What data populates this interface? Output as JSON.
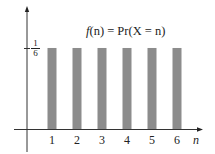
{
  "chart_data": {
    "type": "bar",
    "title": "f(n) = Pr(X = n)",
    "xlabel": "n",
    "ylabel": "",
    "categories": [
      "1",
      "2",
      "3",
      "4",
      "5",
      "6"
    ],
    "values": [
      0.1667,
      0.1667,
      0.1667,
      0.1667,
      0.1667,
      0.1667
    ],
    "y_tick_labels": [
      {
        "value": 0.1667,
        "label_numerator": "1",
        "label_denominator": "6"
      }
    ],
    "ylim": [
      0,
      0.26
    ],
    "grid": false,
    "legend": "none",
    "bar_color": "#8c8c8c"
  },
  "annotation": {
    "f": "f",
    "rest": "(n) = Pr(X = n)"
  },
  "ytick": {
    "num": "1",
    "den": "6"
  },
  "xaxis_label": "n"
}
